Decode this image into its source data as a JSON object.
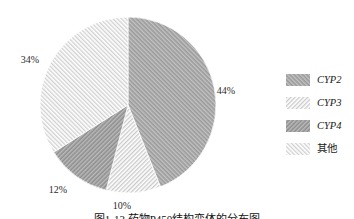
{
  "figure": {
    "caption": "图1-13 药物P450结构变体的分布图"
  },
  "chart_data": {
    "type": "pie",
    "title": "图1-13 药物P450结构变体的分布图",
    "categories": [
      "CYP2",
      "CYP3",
      "CYP4",
      "其他"
    ],
    "values": [
      44,
      10,
      12,
      34
    ],
    "unit": "%",
    "rotation": "first slice starts at 12 o'clock, clockwise",
    "legend_position": "right",
    "slices": [
      {
        "label": "CYP2",
        "value": 44,
        "percent_label": "44%",
        "tone": "dark",
        "hatch": "diagonal-forward",
        "label_x": 226,
        "label_y": 94
      },
      {
        "label": "CYP3",
        "value": 10,
        "percent_label": "10%",
        "tone": "light",
        "hatch": "diagonal-back",
        "label_x": 122,
        "label_y": 209
      },
      {
        "label": "CYP4",
        "value": 12,
        "percent_label": "12%",
        "tone": "dark",
        "hatch": "diagonal-back",
        "label_x": 58,
        "label_y": 193
      },
      {
        "label": "其他",
        "value": 34,
        "percent_label": "34%",
        "tone": "light",
        "hatch": "diagonal-forward",
        "label_x": 30,
        "label_y": 63
      }
    ],
    "colors": {
      "dark_base": "#9a9a9a",
      "dark_line": "#c3c3c3",
      "dark2_base": "#8e8e8e",
      "dark2_line": "#bcbcbc",
      "light_base": "#ffffff",
      "light_line": "#c9c9c9",
      "slice_gap": "#ffffff",
      "text": "#2a2a2a"
    }
  }
}
